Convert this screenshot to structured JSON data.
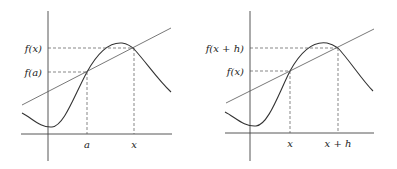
{
  "figures": [
    {
      "id": "left",
      "y_labels": {
        "upper": "f(x)",
        "lower": "f(a)"
      },
      "x_labels": {
        "left": "a",
        "right": "x"
      },
      "description": "Secant line through (a, f(a)) and (x, f(x)) on a smooth curve"
    },
    {
      "id": "right",
      "y_labels": {
        "upper": "f(x + h)",
        "lower": "f(x)"
      },
      "x_labels": {
        "left": "x",
        "right": "x + h"
      },
      "description": "Secant line through (x, f(x)) and (x+h, f(x+h)) on a smooth curve"
    }
  ],
  "colors": {
    "stroke": "#333333",
    "background": "#ffffff"
  }
}
